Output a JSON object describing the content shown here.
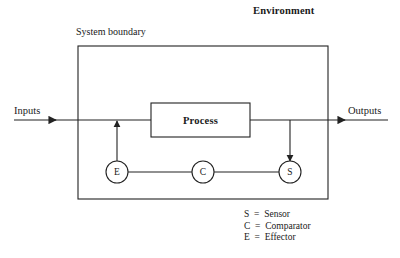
{
  "diagram": {
    "title_label": "Environment",
    "boundary_label": "System boundary",
    "input_label": "Inputs",
    "output_label": "Outputs",
    "process_label": "Process",
    "nodes": [
      {
        "id": "effector",
        "letter": "E",
        "cx": 117,
        "cy": 172
      },
      {
        "id": "comparator",
        "letter": "C",
        "cx": 203,
        "cy": 172
      },
      {
        "id": "sensor",
        "letter": "S",
        "cx": 290,
        "cy": 172
      }
    ],
    "legend": [
      {
        "key": "S",
        "text": "S  =  Sensor"
      },
      {
        "key": "C",
        "text": "C  =  Comparator"
      },
      {
        "key": "E",
        "text": "E  =  Effector"
      }
    ],
    "colors": {
      "stroke": "#222222",
      "text": "#1a1a1a",
      "background": "#ffffff"
    }
  }
}
